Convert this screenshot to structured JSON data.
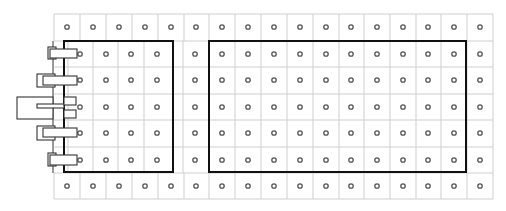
{
  "diagram": {
    "title": "",
    "colors": {
      "background": "#ffffff",
      "grid": "#cfcfcf",
      "hole": "#555555",
      "box": "#111111",
      "connector": "#333333"
    },
    "grid": {
      "left": 54,
      "right": 493,
      "top": 14,
      "bottom": 199,
      "row_lines": [
        14,
        41,
        67,
        94,
        120,
        147,
        173,
        199
      ],
      "outer_columns": [
        54,
        80,
        106,
        132,
        158,
        184,
        209,
        235,
        261,
        287,
        313,
        339,
        364,
        390,
        416,
        441,
        467,
        493
      ],
      "inner_left_columns": [
        68,
        93,
        118,
        144,
        183,
        209
      ],
      "outer_row_centers": [
        27,
        186
      ],
      "inner_row_centers": [
        54,
        80,
        107,
        133,
        160
      ],
      "outer_hole_x": [
        67,
        93,
        119,
        145,
        171,
        196,
        222,
        248,
        274,
        300,
        326,
        351,
        377,
        403,
        428,
        454,
        480
      ],
      "inner_hole_x": [
        80,
        106,
        131,
        157,
        195,
        222,
        248,
        274,
        300,
        326,
        351,
        377,
        403,
        428,
        454,
        480
      ],
      "hole_radius": 2.2
    },
    "boxes": [
      {
        "name": "left-module-box",
        "x": 64,
        "y": 41,
        "w": 109,
        "h": 131
      },
      {
        "name": "right-module-box",
        "x": 209,
        "y": 41,
        "w": 257,
        "h": 131
      }
    ],
    "backplate_line": {
      "x": 53,
      "y1": 41,
      "y2": 173
    },
    "connectors": [
      {
        "name": "connector-1",
        "outer": {
          "x": 48,
          "y": 47,
          "w": 8,
          "h": 12
        },
        "inner": {
          "x": 50,
          "y": 49,
          "w": 27,
          "h": 9
        }
      },
      {
        "name": "connector-2",
        "outer": {
          "x": 37,
          "y": 74,
          "w": 18,
          "h": 13
        },
        "inner": {
          "x": 43,
          "y": 76,
          "w": 34,
          "h": 9
        }
      },
      {
        "name": "connector-3",
        "outer": {
          "x": 17,
          "y": 97,
          "w": 36,
          "h": 22
        },
        "slot": {
          "x": 37,
          "y": 104,
          "w": 27,
          "h": 4
        },
        "tabs": [
          {
            "x": 64,
            "y": 97,
            "w": 12,
            "h": 8
          },
          {
            "x": 64,
            "y": 110,
            "w": 12,
            "h": 8
          }
        ]
      },
      {
        "name": "connector-4",
        "outer": {
          "x": 37,
          "y": 126,
          "w": 18,
          "h": 14
        },
        "inner": {
          "x": 43,
          "y": 128,
          "w": 34,
          "h": 9
        }
      },
      {
        "name": "connector-5",
        "outer": {
          "x": 48,
          "y": 153,
          "w": 8,
          "h": 13
        },
        "inner": {
          "x": 50,
          "y": 155,
          "w": 27,
          "h": 10
        }
      }
    ]
  }
}
